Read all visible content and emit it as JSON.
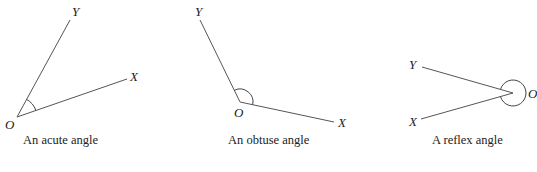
{
  "diagrams": [
    {
      "type": "acute",
      "caption": "An acute angle",
      "labels": {
        "vertex": "O",
        "ray1": "Y",
        "ray2": "X"
      }
    },
    {
      "type": "obtuse",
      "caption": "An obtuse angle",
      "labels": {
        "vertex": "O",
        "ray1": "Y",
        "ray2": "X"
      }
    },
    {
      "type": "reflex",
      "caption": "A reflex angle",
      "labels": {
        "vertex": "O",
        "ray1": "Y",
        "ray2": "X"
      }
    }
  ],
  "colors": {
    "line": "#555555",
    "text": "#222222",
    "background": "#ffffff"
  }
}
